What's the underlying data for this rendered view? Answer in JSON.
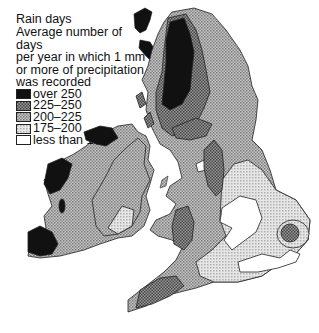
{
  "legend": {
    "title": "Rain days",
    "description_lines": [
      "Average number of days",
      "per year in which 1 mm",
      "or more of precipitation",
      "was recorded"
    ],
    "items": [
      {
        "label": "over 250",
        "fill": "#111111"
      },
      {
        "label": "225–250",
        "fill": "pattern-dark"
      },
      {
        "label": "200–225",
        "fill": "pattern-mid"
      },
      {
        "label": "175–200",
        "fill": "pattern-light"
      },
      {
        "label": "less than 175",
        "fill": "#ffffff"
      }
    ]
  },
  "map": {
    "region": "British Isles and Ireland",
    "style": "black-and-white halftone choropleth"
  }
}
